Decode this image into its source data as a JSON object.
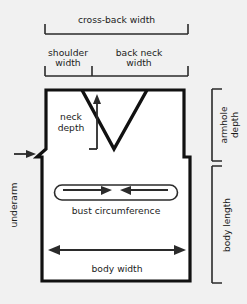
{
  "diagram": {
    "background_color": "#f1f1f1",
    "line_color": "#111111",
    "fill_color": "#ffffff",
    "annotation_color": "#2b2b2b"
  },
  "labels": {
    "cross_back_width": "cross-back width",
    "shoulder_width_line1": "shoulder",
    "shoulder_width_line2": "width",
    "back_neck_width_line1": "back neck",
    "back_neck_width_line2": "width",
    "neck_depth_line1": "neck",
    "neck_depth_line2": "depth",
    "armhole_depth_line1": "armhole",
    "armhole_depth_line2": "depth",
    "body_length": "body length",
    "underarm": "underarm",
    "bust_circumference": "bust circumference",
    "body_width": "body width"
  },
  "measurements": [
    {
      "name": "cross-back width",
      "orientation": "horizontal",
      "position": "top"
    },
    {
      "name": "shoulder width",
      "orientation": "horizontal",
      "position": "top-left"
    },
    {
      "name": "back neck width",
      "orientation": "horizontal",
      "position": "top-right"
    },
    {
      "name": "neck depth",
      "orientation": "vertical",
      "position": "inside-upper-left"
    },
    {
      "name": "armhole depth",
      "orientation": "vertical",
      "position": "right-upper"
    },
    {
      "name": "body length",
      "orientation": "vertical",
      "position": "right-lower"
    },
    {
      "name": "underarm",
      "orientation": "vertical-rotated",
      "position": "left"
    },
    {
      "name": "bust circumference",
      "orientation": "horizontal",
      "position": "inside-middle"
    },
    {
      "name": "body width",
      "orientation": "horizontal",
      "position": "inside-lower"
    }
  ]
}
